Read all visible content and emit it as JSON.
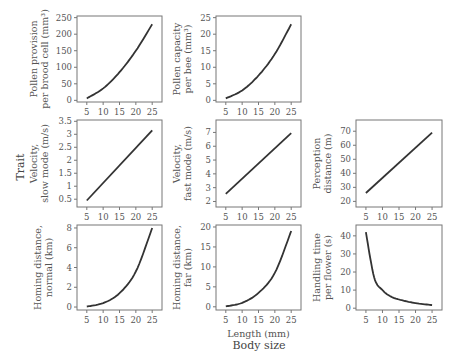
{
  "figure": {
    "y_super_label": "Trait",
    "x_super_label": "Body size",
    "x_axis_label": "Length (mm)"
  },
  "chart_data": [
    {
      "type": "line",
      "panel": "row1-col1",
      "ylabel_lines": [
        "Pollen provision",
        "per brood cell (mm³)"
      ],
      "xlabel": "",
      "x": [
        5,
        10,
        15,
        20,
        25
      ],
      "values": [
        6,
        36,
        85,
        150,
        230
      ],
      "xticks": [
        5,
        10,
        15,
        20,
        25
      ],
      "yticks": [
        0,
        50,
        100,
        150,
        200,
        250
      ],
      "xlim": [
        2,
        28
      ],
      "ylim": [
        -5,
        255
      ],
      "grid": false
    },
    {
      "type": "line",
      "panel": "row1-col2",
      "ylabel_lines": [
        "Pollen capacity",
        "per bee (mm³)"
      ],
      "xlabel": "",
      "x": [
        5,
        10,
        15,
        20,
        25
      ],
      "values": [
        0.6,
        3,
        7.5,
        14,
        23
      ],
      "xticks": [
        5,
        10,
        15,
        20,
        25
      ],
      "yticks": [
        0,
        5,
        10,
        15,
        20,
        25
      ],
      "xlim": [
        2,
        28
      ],
      "ylim": [
        -0.5,
        25.5
      ],
      "grid": false
    },
    {
      "type": "line",
      "panel": "row2-col1",
      "ylabel_lines": [
        "Velocity,",
        "slow mode (m/s)"
      ],
      "xlabel": "",
      "x": [
        5,
        25
      ],
      "values": [
        0.45,
        3.15
      ],
      "xticks": [
        5,
        10,
        15,
        20,
        25
      ],
      "yticks": [
        0.5,
        1.0,
        1.5,
        2.0,
        2.5,
        3.0,
        3.5
      ],
      "xlim": [
        2,
        28
      ],
      "ylim": [
        0.2,
        3.55
      ],
      "grid": false
    },
    {
      "type": "line",
      "panel": "row2-col2",
      "ylabel_lines": [
        "Velocity,",
        "fast mode (m/s)"
      ],
      "xlabel": "",
      "x": [
        5,
        25
      ],
      "values": [
        2.55,
        6.95
      ],
      "xticks": [
        5,
        10,
        15,
        20,
        25
      ],
      "yticks": [
        2,
        3,
        4,
        5,
        6,
        7
      ],
      "xlim": [
        2,
        28
      ],
      "ylim": [
        1.6,
        7.9
      ],
      "grid": false
    },
    {
      "type": "line",
      "panel": "row2-col3",
      "ylabel_lines": [
        "Perception",
        "distance (m)"
      ],
      "xlabel": "",
      "x": [
        5,
        25
      ],
      "values": [
        26,
        69
      ],
      "xticks": [
        5,
        10,
        15,
        20,
        25
      ],
      "yticks": [
        20,
        30,
        40,
        50,
        60,
        70
      ],
      "xlim": [
        2,
        28
      ],
      "ylim": [
        16,
        78
      ],
      "grid": false
    },
    {
      "type": "line",
      "panel": "row3-col1",
      "ylabel_lines": [
        "Homing distance,",
        "normal (km)"
      ],
      "xlabel": "",
      "x": [
        5,
        10,
        15,
        20,
        25
      ],
      "values": [
        0.05,
        0.4,
        1.4,
        3.6,
        8.0
      ],
      "xticks": [
        5,
        10,
        15,
        20,
        25
      ],
      "yticks": [
        0,
        2,
        4,
        6,
        8
      ],
      "xlim": [
        2,
        28
      ],
      "ylim": [
        -0.3,
        8.3
      ],
      "grid": false
    },
    {
      "type": "line",
      "panel": "row3-col2",
      "ylabel_lines": [
        "Homing distance,",
        "far (km)"
      ],
      "xlabel": "Length (mm)",
      "x": [
        5,
        10,
        15,
        20,
        25
      ],
      "values": [
        0.1,
        1.0,
        3.5,
        8.5,
        19
      ],
      "xticks": [
        5,
        10,
        15,
        20,
        25
      ],
      "yticks": [
        0,
        5,
        10,
        15,
        20
      ],
      "xlim": [
        2,
        28
      ],
      "ylim": [
        -0.8,
        20.5
      ],
      "grid": false
    },
    {
      "type": "line",
      "panel": "row3-col3",
      "ylabel_lines": [
        "Handling time",
        "per flower (s)"
      ],
      "xlabel": "",
      "x": [
        5,
        7.5,
        10,
        12.5,
        15,
        20,
        25
      ],
      "values": [
        42,
        17,
        10,
        6.5,
        4.8,
        2.8,
        1.7
      ],
      "xticks": [
        5,
        10,
        15,
        20,
        25
      ],
      "yticks": [
        0,
        10,
        20,
        30,
        40
      ],
      "xlim": [
        2,
        28
      ],
      "ylim": [
        -1,
        46
      ],
      "grid": false
    }
  ]
}
